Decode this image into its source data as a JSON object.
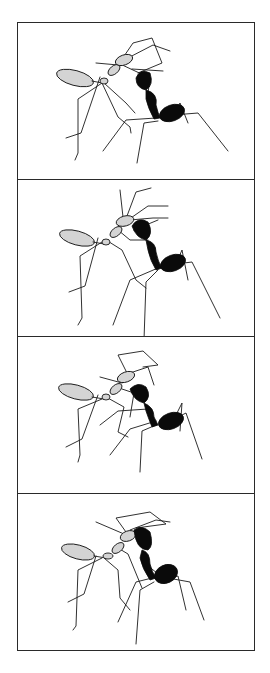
{
  "figure": {
    "panel_count": 4,
    "colors": {
      "border": "#2a2a2a",
      "ant_light": "#d4d4d4",
      "ant_dark": "#0a0a0a",
      "background": "#ffffff"
    },
    "panels": [
      {
        "index": 1,
        "label": ""
      },
      {
        "index": 2,
        "label": ""
      },
      {
        "index": 3,
        "label": ""
      },
      {
        "index": 4,
        "label": ""
      }
    ]
  }
}
